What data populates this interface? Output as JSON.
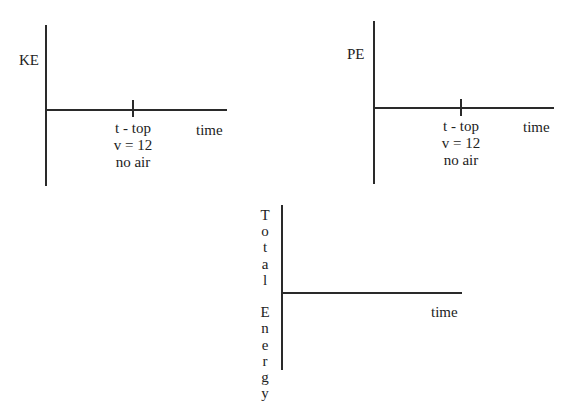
{
  "graphs": [
    {
      "id": "ke",
      "y_label": "KE",
      "x_label": "time",
      "tick_label_lines": [
        "t - top",
        "v = 12",
        "no air"
      ]
    },
    {
      "id": "pe",
      "y_label": "PE",
      "x_label": "time",
      "tick_label_lines": [
        "t - top",
        "v = 12",
        "no air"
      ]
    },
    {
      "id": "total",
      "y_label_letters": [
        "T",
        "o",
        "t",
        "a",
        "l",
        "",
        "E",
        "n",
        "e",
        "r",
        "g",
        "y"
      ],
      "x_label": "time"
    }
  ]
}
